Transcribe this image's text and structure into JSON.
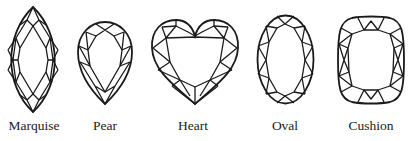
{
  "figure": {
    "shapes": [
      {
        "id": "marquise",
        "label": "Marquise",
        "center_x": 33
      },
      {
        "id": "pear",
        "label": "Pear",
        "center_x": 105
      },
      {
        "id": "heart",
        "label": "Heart",
        "center_x": 193
      },
      {
        "id": "oval",
        "label": "Oval",
        "center_x": 285
      },
      {
        "id": "cushion",
        "label": "Cushion",
        "center_x": 371
      }
    ],
    "line_color": "#1a1a1a",
    "background": "#ffffff"
  }
}
